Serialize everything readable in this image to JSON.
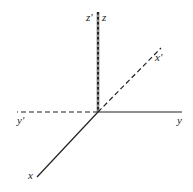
{
  "diagram": {
    "title": "",
    "colors": {
      "line": "#222222",
      "background": "#ffffff"
    },
    "origin": {
      "x": 98,
      "y": 112
    },
    "axes": [
      {
        "id": "z",
        "label": "z",
        "style": "solid",
        "end": {
          "x": 98,
          "y": 12
        },
        "label_pos": {
          "x": 102,
          "y": 21
        }
      },
      {
        "id": "z_prime",
        "label": "z'",
        "style": "dashed",
        "end": {
          "x": 98,
          "y": 12
        },
        "label_pos": {
          "x": 86,
          "y": 21
        }
      },
      {
        "id": "y",
        "label": "y",
        "style": "solid",
        "end": {
          "x": 182,
          "y": 112
        },
        "label_pos": {
          "x": 177,
          "y": 124
        }
      },
      {
        "id": "y_prime",
        "label": "y'",
        "style": "dashed",
        "end": {
          "x": 17,
          "y": 112
        },
        "label_pos": {
          "x": 17,
          "y": 124
        }
      },
      {
        "id": "x",
        "label": "x",
        "style": "solid",
        "end": {
          "x": 37,
          "y": 177
        },
        "label_pos": {
          "x": 28,
          "y": 179
        }
      },
      {
        "id": "x_prime",
        "label": "x'",
        "style": "dashed",
        "end": {
          "x": 161,
          "y": 48
        },
        "label_pos": {
          "x": 155,
          "y": 61
        }
      }
    ]
  }
}
